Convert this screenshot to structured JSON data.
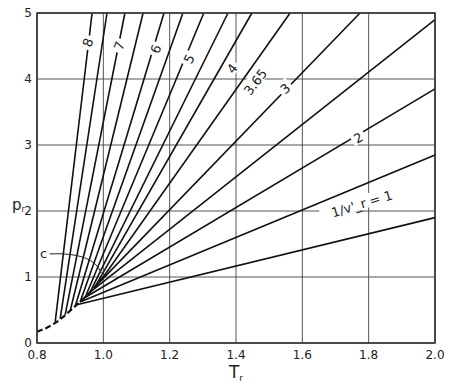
{
  "chart_data": {
    "type": "line",
    "title": "",
    "xlabel": "T_r",
    "ylabel": "p_r",
    "xlim": [
      0.8,
      2.0
    ],
    "ylim": [
      0,
      5
    ],
    "x_ticks": [
      "0.8",
      "1.0",
      "1.2",
      "1.4",
      "1.6",
      "1.8",
      "2.0"
    ],
    "y_ticks": [
      "0",
      "1",
      "2",
      "3",
      "4",
      "5"
    ],
    "grid": true,
    "critical_point": {
      "label": "c",
      "T": 1.0,
      "p": 1.0
    },
    "saturation_curve": {
      "style": "dashed",
      "points": [
        [
          0.8,
          0.17
        ],
        [
          0.83,
          0.23
        ],
        [
          0.86,
          0.32
        ],
        [
          0.88,
          0.4
        ],
        [
          0.9,
          0.49
        ],
        [
          0.92,
          0.58
        ],
        [
          0.94,
          0.67
        ],
        [
          0.96,
          0.77
        ],
        [
          0.98,
          0.88
        ],
        [
          1.0,
          1.0
        ]
      ]
    },
    "series": [
      {
        "name": "8",
        "label": "8",
        "points": [
          [
            0.855,
            0.32
          ],
          [
            0.966,
            5.0
          ]
        ]
      },
      {
        "name": "7.5",
        "label": "",
        "points": [
          [
            0.87,
            0.37
          ],
          [
            1.011,
            5.0
          ]
        ]
      },
      {
        "name": "7",
        "label": "7",
        "points": [
          [
            0.885,
            0.43
          ],
          [
            1.065,
            5.0
          ]
        ]
      },
      {
        "name": "6.5",
        "label": "",
        "points": [
          [
            0.9,
            0.49
          ],
          [
            1.12,
            5.0
          ]
        ]
      },
      {
        "name": "6",
        "label": "6",
        "points": [
          [
            0.915,
            0.55
          ],
          [
            1.183,
            5.0
          ]
        ]
      },
      {
        "name": "5.5",
        "label": "",
        "points": [
          [
            0.93,
            0.62
          ],
          [
            1.24,
            5.0
          ]
        ]
      },
      {
        "name": "5",
        "label": "5",
        "points": [
          [
            0.945,
            0.69
          ],
          [
            1.303,
            5.0
          ]
        ]
      },
      {
        "name": "4.5",
        "label": "",
        "points": [
          [
            0.96,
            0.77
          ],
          [
            1.376,
            5.0
          ]
        ]
      },
      {
        "name": "4",
        "label": "4",
        "points": [
          [
            0.975,
            0.85
          ],
          [
            1.448,
            5.0
          ]
        ]
      },
      {
        "name": "3.65",
        "label": "3.65",
        "points": [
          [
            1.0,
            1.0
          ],
          [
            1.563,
            5.0
          ]
        ]
      },
      {
        "name": "3",
        "label": "3",
        "points": [
          [
            0.975,
            0.85
          ],
          [
            1.774,
            5.0
          ]
        ]
      },
      {
        "name": "2.5",
        "label": "",
        "points": [
          [
            0.96,
            0.77
          ],
          [
            2.0,
            4.9
          ]
        ]
      },
      {
        "name": "2",
        "label": "2",
        "points": [
          [
            0.945,
            0.69
          ],
          [
            2.0,
            3.85
          ]
        ]
      },
      {
        "name": "1.5",
        "label": "",
        "points": [
          [
            0.93,
            0.62
          ],
          [
            2.0,
            2.85
          ]
        ]
      },
      {
        "name": "1",
        "label": "1/v'_r = 1",
        "points": [
          [
            0.92,
            0.58
          ],
          [
            2.0,
            1.9
          ]
        ]
      }
    ],
    "annotations": [
      {
        "text": "c",
        "T": 0.82,
        "p": 1.35,
        "arrow_to": [
          1.0,
          1.0
        ]
      },
      {
        "text": "8",
        "T": 0.955,
        "p": 4.55
      },
      {
        "text": "7",
        "T": 1.05,
        "p": 4.5
      },
      {
        "text": "6",
        "T": 1.16,
        "p": 4.45
      },
      {
        "text": "5",
        "T": 1.26,
        "p": 4.3
      },
      {
        "text": "4",
        "T": 1.39,
        "p": 4.15
      },
      {
        "text": "3.65",
        "T": 1.46,
        "p": 3.95
      },
      {
        "text": "3",
        "T": 1.55,
        "p": 3.85
      },
      {
        "text": "2",
        "T": 1.77,
        "p": 3.1
      },
      {
        "text": "1/v'_r = 1",
        "T": 1.78,
        "p": 2.1
      }
    ]
  },
  "axes": {
    "x_label": "T",
    "x_label_sub": "r",
    "y_label": "p",
    "y_label_sub": "r"
  }
}
